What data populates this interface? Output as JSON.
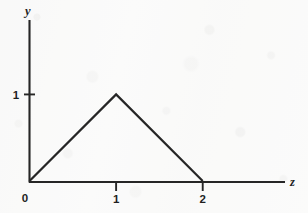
{
  "figure": {
    "kind": "line-plot",
    "background_color": "#fcfcfc",
    "ink_color": "#262626"
  },
  "axes": {
    "x_axis_name": "z",
    "y_axis_name": "y",
    "origin_label": "0"
  },
  "chart_data": {
    "type": "line",
    "title": "",
    "xlabel": "z",
    "ylabel": "y",
    "xlim": [
      0,
      2.95
    ],
    "ylim": [
      0,
      1.85
    ],
    "xticks": [
      1,
      2
    ],
    "xticklabels": [
      "1",
      "2"
    ],
    "yticks": [
      1
    ],
    "yticklabels": [
      "1"
    ],
    "origin_label": "0",
    "grid": false,
    "legend": null,
    "series": [
      {
        "name": "triangular pulse",
        "x": [
          0,
          1,
          2
        ],
        "y": [
          0,
          1,
          0
        ]
      }
    ],
    "annotations": []
  }
}
